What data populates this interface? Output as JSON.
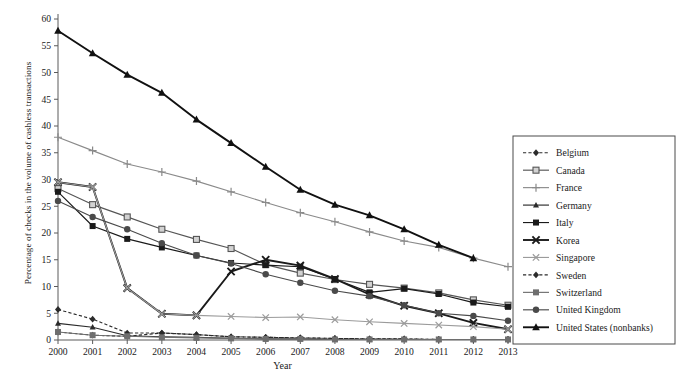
{
  "chart_data": {
    "type": "line",
    "title": "",
    "xlabel": "Year",
    "ylabel": "Percentage of checks in the volume of cashless transactions",
    "x": [
      2000,
      2001,
      2002,
      2003,
      2004,
      2005,
      2006,
      2007,
      2008,
      2009,
      2010,
      2011,
      2012,
      2013
    ],
    "xlim": [
      2000,
      2013
    ],
    "ylim": [
      0,
      60
    ],
    "yticks": [
      0,
      5,
      10,
      15,
      20,
      25,
      30,
      35,
      40,
      45,
      50,
      55,
      60
    ],
    "xticks": [
      "2000",
      "2001",
      "2002",
      "2003",
      "2004",
      "2005",
      "2006",
      "2007",
      "2008",
      "2009",
      "2010",
      "2011",
      "2012",
      "2013"
    ],
    "grid": false,
    "legend_position": "right",
    "series": [
      {
        "name": "Belgium",
        "marker": "diamond",
        "dash": "dashed",
        "color": "#2b2b2b",
        "values": [
          5.7,
          3.9,
          1.3,
          1.3,
          1.0,
          0.6,
          0.5,
          0.4,
          0.3,
          0.2,
          0.2,
          0.1,
          0.1,
          0.1
        ]
      },
      {
        "name": "Canada",
        "marker": "open-square",
        "dash": "solid",
        "color": "#555555",
        "values": [
          28.3,
          25.3,
          23.0,
          20.7,
          18.8,
          17.1,
          14.1,
          12.5,
          11.3,
          10.4,
          9.7,
          8.8,
          7.5,
          6.5
        ]
      },
      {
        "name": "France",
        "marker": "plus",
        "dash": "solid",
        "color": "#8a8a8a",
        "values": [
          37.9,
          35.4,
          32.9,
          31.4,
          29.7,
          27.7,
          25.7,
          23.8,
          22.1,
          20.2,
          18.5,
          17.3,
          15.3,
          13.7
        ]
      },
      {
        "name": "Germany",
        "marker": "triangle-small",
        "dash": "solid",
        "color": "#2b2b2b",
        "values": [
          3.1,
          2.4,
          0.8,
          0.6,
          0.5,
          0.3,
          0.2,
          0.2,
          0.1,
          0.1,
          0.1,
          0.1,
          0.1,
          0.1
        ]
      },
      {
        "name": "Italy",
        "marker": "filled-square",
        "dash": "solid",
        "color": "#1a1a1a",
        "values": [
          27.7,
          21.3,
          18.9,
          17.3,
          15.8,
          14.4,
          14.0,
          13.7,
          11.4,
          8.9,
          9.6,
          8.6,
          7.0,
          6.2
        ]
      },
      {
        "name": "Korea",
        "marker": "x-bold",
        "dash": "solid",
        "color": "#1a1a1a",
        "values": [
          29.5,
          28.6,
          9.7,
          4.9,
          4.6,
          12.8,
          15.0,
          13.9,
          11.4,
          8.5,
          6.4,
          5.0,
          3.2,
          2.0
        ]
      },
      {
        "name": "Singapore",
        "marker": "x-light",
        "dash": "solid",
        "color": "#9b9b9b",
        "values": [
          29.5,
          28.6,
          9.7,
          4.9,
          4.6,
          4.4,
          4.2,
          4.3,
          3.8,
          3.4,
          3.1,
          2.8,
          2.5,
          2.0
        ]
      },
      {
        "name": "Sweden",
        "marker": "diamond",
        "dash": "dashed",
        "color": "#2b2b2b",
        "values": [
          1.5,
          0.9,
          0.7,
          1.3,
          1.0,
          0.6,
          0.5,
          0.4,
          0.3,
          0.2,
          0.2,
          0.1,
          0.1,
          0.1
        ]
      },
      {
        "name": "Switzerland",
        "marker": "filled-square",
        "dash": "solid",
        "color": "#6e6e6e",
        "values": [
          1.5,
          0.9,
          0.7,
          0.5,
          0.4,
          0.3,
          0.2,
          0.2,
          0.1,
          0.1,
          0.1,
          0.1,
          0.1,
          0.1
        ]
      },
      {
        "name": "United Kingdom",
        "marker": "filled-circle",
        "dash": "solid",
        "color": "#4a4a4a",
        "values": [
          26.0,
          23.0,
          20.7,
          18.1,
          15.8,
          14.3,
          12.3,
          10.7,
          9.2,
          8.2,
          6.5,
          5.0,
          4.5,
          3.6
        ]
      },
      {
        "name": "United States (nonbanks)",
        "marker": "triangle",
        "dash": "solid",
        "color": "#111111",
        "values": [
          57.8,
          53.6,
          49.6,
          46.2,
          41.2,
          36.8,
          32.4,
          28.1,
          25.3,
          23.3,
          20.7,
          17.8,
          15.3,
          null
        ]
      }
    ]
  },
  "legend": {
    "items": [
      "Belgium",
      "Canada",
      "France",
      "Germany",
      "Italy",
      "Korea",
      "Singapore",
      "Sweden",
      "Switzerland",
      "United Kingdom",
      "United States (nonbanks)"
    ]
  }
}
